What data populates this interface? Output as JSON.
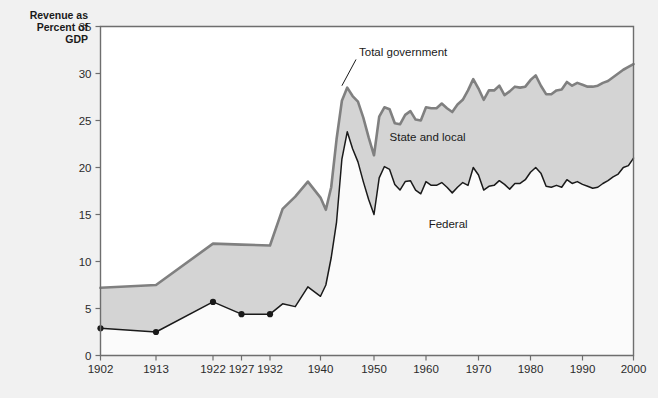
{
  "chart_data": {
    "type": "area",
    "title": "",
    "subtitle": "",
    "ylabel": "Revenue as Percent of GDP",
    "xlabel": "",
    "ylim": [
      0,
      35
    ],
    "yticks": [
      0,
      5,
      10,
      15,
      20,
      25,
      30,
      35
    ],
    "xlim": [
      1902,
      2000
    ],
    "xticks": [
      1902,
      1913,
      1922,
      1927,
      1932,
      1940,
      1950,
      1960,
      1970,
      1980,
      1990,
      2000
    ],
    "xtick_labels": [
      "1902",
      "1913",
      "1922",
      "1927",
      "1932",
      "1940",
      "1950",
      "1960",
      "1970",
      "1980",
      "1990",
      "2000"
    ],
    "ytick_labels": [
      "0",
      "5",
      "10",
      "15",
      "20",
      "25",
      "30",
      "35"
    ],
    "grid": false,
    "legend_position": "inline-annotations",
    "annotations": [
      {
        "name": "total-government",
        "text": "Total government",
        "x": 1947.2,
        "y": 31.6,
        "leader_to_x": 1944.0,
        "leader_to_y": 28.7
      },
      {
        "name": "state-and-local",
        "text": "State and local",
        "x": 1953.0,
        "y": 22.6
      },
      {
        "name": "federal",
        "text": "Federal",
        "x": 1960.5,
        "y": 13.3
      }
    ],
    "series": [
      {
        "name": "Total government",
        "color": "#808080",
        "fill": "#d4d4d4",
        "x": [
          1902,
          1913,
          1922,
          1927,
          1932,
          1934,
          1936,
          1938,
          1940,
          1941,
          1942,
          1943,
          1944,
          1945,
          1946,
          1947,
          1948,
          1949,
          1950,
          1951,
          1952,
          1953,
          1954,
          1955,
          1956,
          1957,
          1958,
          1959,
          1960,
          1961,
          1962,
          1963,
          1964,
          1965,
          1966,
          1967,
          1968,
          1969,
          1970,
          1971,
          1972,
          1973,
          1974,
          1975,
          1976,
          1977,
          1978,
          1979,
          1980,
          1981,
          1982,
          1983,
          1984,
          1985,
          1986,
          1987,
          1988,
          1989,
          1990,
          1991,
          1992,
          1993,
          1994,
          1995,
          1996,
          1997,
          1998,
          1999,
          2000
        ],
        "values": [
          7.2,
          7.5,
          11.9,
          11.8,
          11.7,
          15.6,
          16.9,
          18.5,
          16.8,
          15.5,
          17.9,
          23.0,
          27.1,
          28.5,
          27.6,
          27.0,
          25.3,
          23.2,
          21.3,
          25.4,
          26.4,
          26.2,
          24.7,
          24.6,
          25.6,
          26.0,
          25.1,
          25.0,
          26.4,
          26.3,
          26.3,
          26.8,
          26.3,
          25.9,
          26.7,
          27.2,
          28.2,
          29.4,
          28.4,
          27.2,
          28.2,
          28.2,
          28.7,
          27.7,
          28.1,
          28.6,
          28.5,
          28.6,
          29.3,
          29.8,
          28.7,
          27.8,
          27.8,
          28.2,
          28.3,
          29.1,
          28.7,
          29.0,
          28.8,
          28.6,
          28.6,
          28.7,
          29.0,
          29.2,
          29.6,
          30.0,
          30.4,
          30.7,
          31.0
        ]
      },
      {
        "name": "Federal",
        "color": "#1a1a1a",
        "fill": "#fbfbfb",
        "markers_through_year": 1932,
        "x": [
          1902,
          1913,
          1922,
          1927,
          1932,
          1934,
          1936,
          1938,
          1940,
          1941,
          1942,
          1943,
          1944,
          1945,
          1946,
          1947,
          1948,
          1949,
          1950,
          1951,
          1952,
          1953,
          1954,
          1955,
          1956,
          1957,
          1958,
          1959,
          1960,
          1961,
          1962,
          1963,
          1964,
          1965,
          1966,
          1967,
          1968,
          1969,
          1970,
          1971,
          1972,
          1973,
          1974,
          1975,
          1976,
          1977,
          1978,
          1979,
          1980,
          1981,
          1982,
          1983,
          1984,
          1985,
          1986,
          1987,
          1988,
          1989,
          1990,
          1991,
          1992,
          1993,
          1994,
          1995,
          1996,
          1997,
          1998,
          1999,
          2000
        ],
        "values": [
          2.9,
          2.5,
          5.7,
          4.4,
          4.4,
          5.5,
          5.2,
          7.3,
          6.3,
          7.5,
          10.4,
          14.2,
          20.9,
          23.8,
          22.0,
          20.6,
          18.5,
          16.6,
          15.0,
          18.9,
          20.1,
          19.8,
          18.2,
          17.6,
          18.5,
          18.6,
          17.6,
          17.2,
          18.5,
          18.1,
          18.1,
          18.4,
          17.9,
          17.3,
          17.9,
          18.4,
          18.1,
          20.0,
          19.2,
          17.6,
          18.0,
          18.1,
          18.6,
          18.2,
          17.7,
          18.3,
          18.3,
          18.7,
          19.5,
          20.0,
          19.4,
          18.0,
          17.9,
          18.1,
          17.9,
          18.7,
          18.3,
          18.5,
          18.2,
          18.0,
          17.8,
          17.9,
          18.3,
          18.6,
          19.0,
          19.3,
          20.0,
          20.2,
          21.0
        ]
      }
    ]
  },
  "axis_title": {
    "line1": "Revenue as",
    "line2": "Percent of",
    "line3": "GDP"
  }
}
